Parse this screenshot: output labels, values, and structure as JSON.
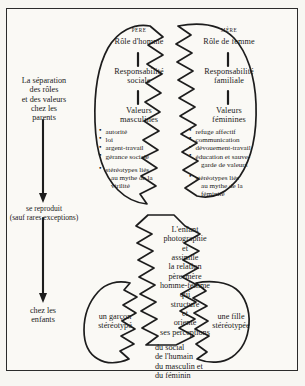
{
  "diagram": {
    "title_hidden": "",
    "left_flow": {
      "step1": "La séparation\ndes rôles\net des valeurs\nchez les\nparents",
      "step2": "se reproduit\n(sauf rares exceptions)",
      "step3": "chez les\nenfants"
    },
    "father": {
      "caps_label": "PÈRE",
      "role": "Rôle  d'homme",
      "responsibility": "Responsabilité\nsociale",
      "values_title": "Valeurs\nmasculines",
      "values": [
        "autorité",
        "loi",
        "argent-travail",
        "gérance  sociale"
      ],
      "stereotype": "stéréotypes  liés",
      "stereotype_line2": "au  mythe  de  la",
      "stereotype_line3": "virilité"
    },
    "mother": {
      "caps_label": "MÈRE",
      "role": "Rôle  de  femme",
      "responsibility": "Responsabilité\nfamiliale",
      "values_title": "Valeurs\nféminines",
      "values": [
        "refuge  affectif",
        "communication",
        "dévouement-travail",
        "éducation  et  sauve-"
      ],
      "values_cont": "garde  de  valeurs",
      "stereotype": "stéréotypes  liés",
      "stereotype_line2": "au  mythe  de  la",
      "stereotype_line3": "féminité"
    },
    "child": {
      "lines": [
        "L'enfant",
        "photographie",
        "et",
        "assimile",
        "la  relation",
        "père-mère",
        "homme-femme",
        "qui",
        "structure",
        "et",
        "oriente",
        "ses  perceptions"
      ],
      "domains": [
        "du social",
        "de l'humain",
        "du masculin  et",
        "du féminin"
      ]
    },
    "boy": "un  garçon\nstéréotypé",
    "girl": "une  fille\nstéréotypée",
    "colors": {
      "ink": "#1a1a1a",
      "stroke": "#2b2b2b",
      "paper": "#faf9f5",
      "page": "#f7f6f2"
    }
  }
}
